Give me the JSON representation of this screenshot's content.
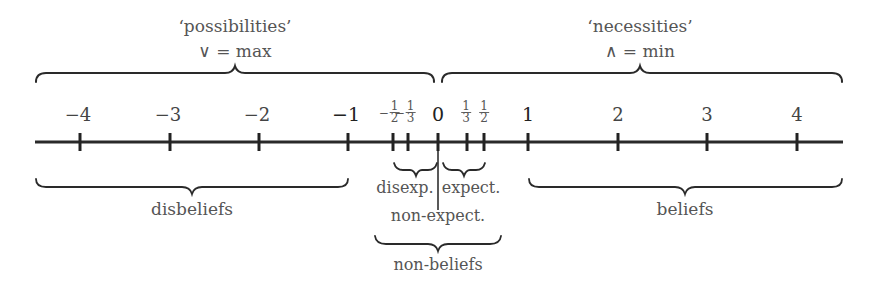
{
  "top_groups": {
    "possibilities": {
      "title": "‘possibilities’",
      "formula": "∨ = max"
    },
    "necessities": {
      "title": "‘necessities’",
      "formula": "∧ = min"
    }
  },
  "axis": {
    "ticks": [
      {
        "label": "−4",
        "value": -4
      },
      {
        "label": "−3",
        "value": -3
      },
      {
        "label": "−2",
        "value": -2
      },
      {
        "label": "−1",
        "value": -1
      },
      {
        "sign": "−",
        "num": "1",
        "den": "2",
        "value": -0.5
      },
      {
        "sign": "−",
        "num": "1",
        "den": "3",
        "value": -0.3333
      },
      {
        "label": "0",
        "value": 0
      },
      {
        "num": "1",
        "den": "3",
        "value": 0.3333
      },
      {
        "num": "1",
        "den": "2",
        "value": 0.5
      },
      {
        "label": "1",
        "value": 1
      },
      {
        "label": "2",
        "value": 2
      },
      {
        "label": "3",
        "value": 3
      },
      {
        "label": "4",
        "value": 4
      }
    ]
  },
  "bottom_groups": {
    "disbeliefs": "disbeliefs",
    "disexp": "disexp.",
    "expect": "expect.",
    "non_expect": "non-expect.",
    "non_beliefs": "non-beliefs",
    "beliefs": "beliefs"
  }
}
